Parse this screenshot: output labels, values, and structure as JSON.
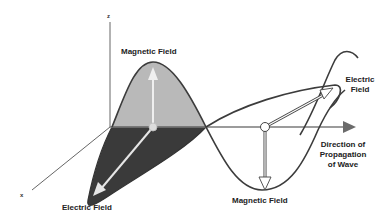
{
  "diagram": {
    "axes": {
      "z_label": "z",
      "x_label": "x"
    },
    "labels": {
      "magnetic_top": "Magnetic Field",
      "electric_bottom": "Electric Field",
      "electric_right_line1": "Electric",
      "electric_right_line2": "Field",
      "direction_line1": "Direction of",
      "direction_line2": "Propagation",
      "direction_line3": "of Wave",
      "magnetic_bottom": "Magnetic Field"
    },
    "colors": {
      "line": "#444444",
      "magnetic_fill": "#b9b9b9",
      "electric_fill": "#3a3a3a",
      "arrow_light": "#e6e6e6",
      "axis_arrow": "#6b6b6b"
    }
  }
}
